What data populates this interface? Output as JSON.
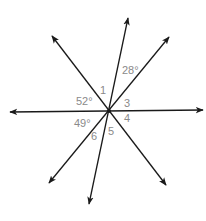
{
  "diagram": {
    "type": "intersecting-lines",
    "center": {
      "x": 109,
      "y": 111
    },
    "lines": [
      {
        "id": "horizontal",
        "end_a": {
          "x": 10,
          "y": 112
        },
        "end_b": {
          "x": 203,
          "y": 110
        }
      },
      {
        "id": "steep",
        "end_a": {
          "x": 128,
          "y": 18
        },
        "end_b": {
          "x": 89,
          "y": 204
        }
      },
      {
        "id": "nw-se",
        "end_a": {
          "x": 52,
          "y": 36
        },
        "end_b": {
          "x": 166,
          "y": 185
        }
      },
      {
        "id": "ne-sw",
        "end_a": {
          "x": 169,
          "y": 37
        },
        "end_b": {
          "x": 49,
          "y": 183
        }
      }
    ],
    "labels": [
      {
        "id": "angle-28",
        "text": "28°",
        "x": 122,
        "y": 74
      },
      {
        "id": "angle-1",
        "text": "1",
        "x": 100,
        "y": 94
      },
      {
        "id": "angle-52",
        "text": "52°",
        "x": 76,
        "y": 105
      },
      {
        "id": "angle-3",
        "text": "3",
        "x": 124,
        "y": 107
      },
      {
        "id": "angle-4",
        "text": "4",
        "x": 124,
        "y": 122
      },
      {
        "id": "angle-49",
        "text": "49°",
        "x": 74,
        "y": 127
      },
      {
        "id": "angle-5",
        "text": "5",
        "x": 108,
        "y": 135
      },
      {
        "id": "angle-6",
        "text": "6",
        "x": 91,
        "y": 140
      }
    ],
    "colors": {
      "line": "#1a1a1a",
      "label": "#8a8a8a",
      "background": "#ffffff"
    }
  }
}
